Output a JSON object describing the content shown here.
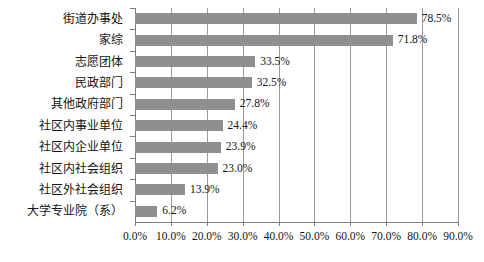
{
  "chart_data": {
    "type": "bar",
    "orientation": "horizontal",
    "title": "",
    "xlabel": "",
    "ylabel": "",
    "xlim": [
      0,
      90
    ],
    "grid": true,
    "legend": false,
    "bar_color": "#8f8f8f",
    "categories": [
      "街道办事处",
      "家综",
      "志愿团体",
      "民政部门",
      "其他政府部门",
      "社区内事业单位",
      "社区内企业单位",
      "社区内社会组织",
      "社区外社会组织",
      "大学专业院（系）"
    ],
    "values": [
      78.5,
      71.8,
      33.5,
      32.5,
      27.8,
      24.4,
      23.9,
      23.0,
      13.9,
      6.2
    ],
    "value_labels": [
      "78.5%",
      "71.8%",
      "33.5%",
      "32.5%",
      "27.8%",
      "24.4%",
      "23.9%",
      "23.0%",
      "13.9%",
      "6.2%"
    ],
    "xticks": [
      0,
      10,
      20,
      30,
      40,
      50,
      60,
      70,
      80,
      90
    ],
    "xtick_labels": [
      "0.0%",
      "10.0%",
      "20.0%",
      "30.0%",
      "40.0%",
      "50.0%",
      "60.0%",
      "70.0%",
      "80.0%",
      "90.0%"
    ]
  }
}
